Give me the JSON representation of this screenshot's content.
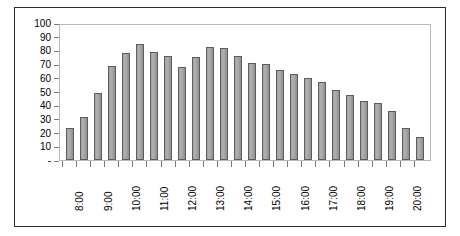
{
  "chart_data": {
    "type": "bar",
    "title": "",
    "xlabel": "",
    "ylabel": "",
    "ylim": [
      0,
      100
    ],
    "y_ticks": [
      "-",
      "10",
      "20",
      "30",
      "40",
      "50",
      "60",
      "70",
      "80",
      "90",
      "100"
    ],
    "y_tick_values": [
      0,
      10,
      20,
      30,
      40,
      50,
      60,
      70,
      80,
      90,
      100
    ],
    "grid": false,
    "legend": "none",
    "zero_label_style": "accounting-dash",
    "x_tick_labels": [
      "8:00",
      "9:00",
      "10:00",
      "11:00",
      "12:00",
      "13:00",
      "14:00",
      "15:00",
      "16:00",
      "17:00",
      "18:00",
      "19:00",
      "20:00"
    ],
    "x_tick_label_rotation": -90,
    "bar_interval_minutes": 30,
    "categories": [
      "8:00",
      "8:30",
      "9:00",
      "9:30",
      "10:00",
      "10:30",
      "11:00",
      "11:30",
      "12:00",
      "12:30",
      "13:00",
      "13:30",
      "14:00",
      "14:30",
      "15:00",
      "15:30",
      "16:00",
      "16:30",
      "17:00",
      "17:30",
      "18:00",
      "18:30",
      "19:00",
      "19:30",
      "20:00",
      "20:30"
    ],
    "values": [
      24,
      32,
      50,
      70,
      79,
      86,
      80,
      77,
      69,
      76,
      84,
      83,
      77,
      72,
      71,
      67,
      64,
      61,
      58,
      52,
      48,
      44,
      42,
      36,
      24,
      17
    ],
    "colors": {
      "bar_fill": "#a8a8a8",
      "bar_border": "#5d5d5d",
      "plot_border": "#b9b9b9",
      "frame_border": "#2b2b2b",
      "axis_tick": "#7a7a7a",
      "text": "#000000",
      "background": "#ffffff"
    }
  }
}
